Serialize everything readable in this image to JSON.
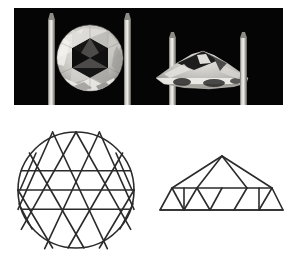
{
  "figure": {
    "background_color": "#ffffff",
    "line_color": "#2b2b2b"
  },
  "photo_panel": {
    "name": "gemstone-photograph",
    "background_color": "#050505",
    "frame": {
      "x": 14,
      "y": 8,
      "width": 269,
      "height": 97
    },
    "subjects": [
      {
        "name": "face-up-rose-cut-diamond",
        "view": "face-up / crown view",
        "description": "Round rose cut diamond gripped by two metal tweezer prongs, showing a hexagonal table reflection surrounded by triangular crown facets",
        "center_x": 90,
        "center_y": 58,
        "radius": 33,
        "prong_positions": [
          52,
          128
        ]
      },
      {
        "name": "profile-rose-cut-diamond",
        "view": "profile / side view",
        "description": "Same rose cut diamond seen edge-on, a low dome rising to a central apex above a flat base",
        "center_x": 203,
        "center_y": 62,
        "half_width": 47,
        "height": 24,
        "prong_positions": [
          172,
          240
        ]
      }
    ]
  },
  "diagrams": {
    "crown_diagram": {
      "name": "rose-cut-crown-facet-diagram",
      "description": "Plan view of a 24 facet rose cut: circular girdle outline filled with an equilateral triangular facet grid",
      "type": "line-drawing",
      "stroke_color": "#2b2b2b",
      "stroke_width": 1.6,
      "circle": {
        "cx": 76,
        "cy": 78,
        "r": 58
      },
      "grid_rows": 6,
      "facet_count": 24,
      "horizontal_chord_count": 3
    },
    "profile_diagram": {
      "name": "rose-cut-profile-facet-diagram",
      "description": "Side elevation of the rose cut: flat base, horizontal girdle, and triangular facets converging on a single apex",
      "type": "line-drawing",
      "stroke_color": "#2b2b2b",
      "stroke_width": 1.6,
      "apex": {
        "x": 222,
        "y": 44
      },
      "base_left": {
        "x": 160,
        "y": 98
      },
      "base_right": {
        "x": 283,
        "y": 98
      },
      "girdle_y": 76,
      "girdle_left": {
        "x": 172,
        "y": 76
      },
      "girdle_right": {
        "x": 272,
        "y": 76
      }
    }
  }
}
